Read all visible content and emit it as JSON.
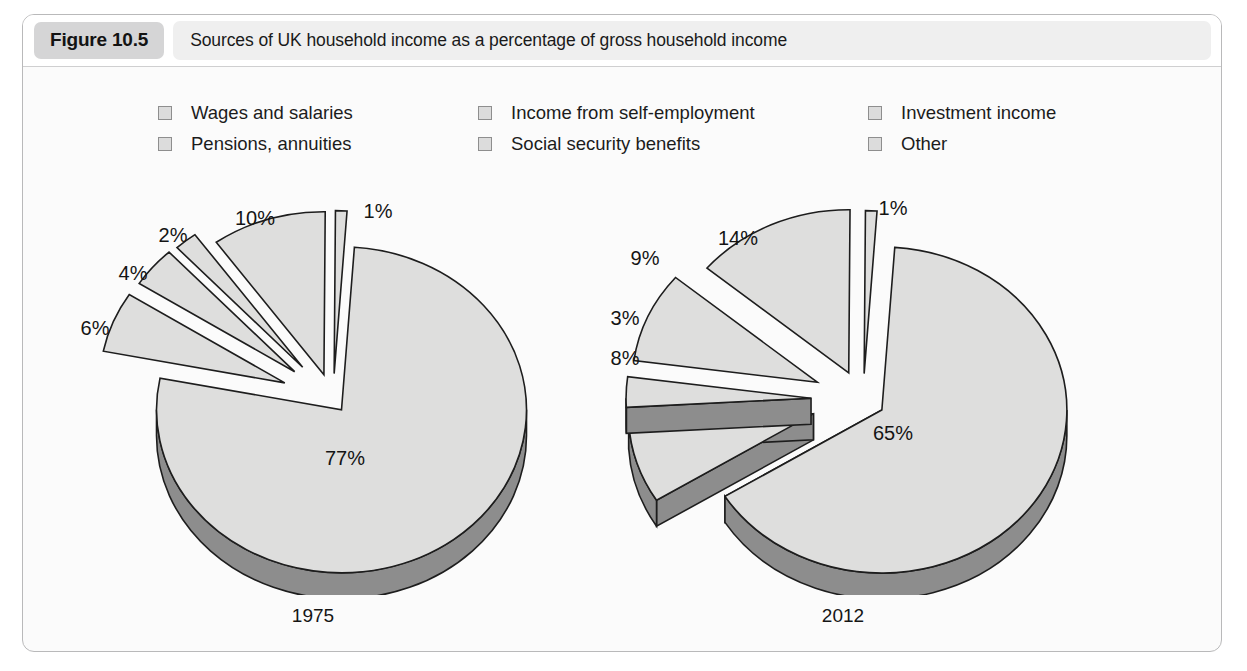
{
  "figure": {
    "badge": "Figure 10.5",
    "title": "Sources of UK household income as a percentage of gross household income"
  },
  "legend": {
    "items": [
      {
        "label": "Wages and salaries",
        "swatch": "legend-swatch-icon"
      },
      {
        "label": "Income from self-employment",
        "swatch": "legend-swatch-icon"
      },
      {
        "label": "Investment income",
        "swatch": "legend-swatch-icon"
      },
      {
        "label": "Pensions, annuities",
        "swatch": "legend-swatch-icon"
      },
      {
        "label": "Social security benefits",
        "swatch": "legend-swatch-icon"
      },
      {
        "label": "Other",
        "swatch": "legend-swatch-icon"
      }
    ]
  },
  "colors": {
    "slice_top": "#dededd",
    "slice_side": "#8d8d8d",
    "slice_outline": "#1d1d1d",
    "panel_bg": "#fbfbfb",
    "panel_border": "#b9b9ba",
    "badge_bg": "#d5d5d6",
    "title_strip_bg": "#efefef",
    "legend_swatch_fill": "#dcdcdc",
    "legend_swatch_border": "#8e8e8e"
  },
  "chart_data": [
    {
      "type": "pie",
      "title": "1975",
      "exploded": true,
      "three_d": true,
      "categories": [
        "Wages and salaries",
        "Income from self-employment",
        "Investment income",
        "Pensions, annuities",
        "Social security benefits",
        "Other"
      ],
      "values": [
        77,
        6,
        4,
        2,
        10,
        1
      ],
      "labels": [
        "77%",
        "6%",
        "4%",
        "2%",
        "10%",
        "1%"
      ],
      "unit": "%",
      "legend_position": "top"
    },
    {
      "type": "pie",
      "title": "2012",
      "exploded": true,
      "three_d": true,
      "categories": [
        "Wages and salaries",
        "Income from self-employment",
        "Investment income",
        "Pensions, annuities",
        "Social security benefits",
        "Other"
      ],
      "values": [
        65,
        8,
        3,
        9,
        14,
        1
      ],
      "labels": [
        "65%",
        "8%",
        "3%",
        "9%",
        "14%",
        "1%"
      ],
      "unit": "%",
      "legend_position": "top"
    }
  ]
}
